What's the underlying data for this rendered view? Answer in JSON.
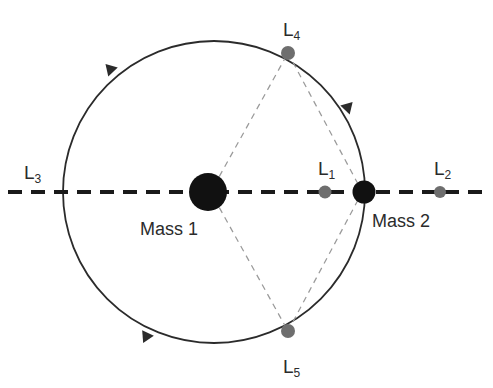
{
  "figure": {
    "background_color": "#ffffff"
  },
  "colors": {
    "body_fill": "#111111",
    "lagrange_fill": "#6e6e6e",
    "orbit_stroke": "#2b2b2b",
    "axis_stroke": "#1a1a1a",
    "connector_stroke": "#9a9a9a",
    "label_color": "#2b2b2b"
  },
  "bodies": [
    {
      "id": "mass-1",
      "label": "Mass 1",
      "label_base": "Mass",
      "label_index": "1",
      "cx": 208,
      "cy": 192,
      "r": 19,
      "fill": "#111111"
    },
    {
      "id": "mass-2",
      "label": "Mass 2",
      "label_base": "Mass",
      "label_index": "2",
      "cx": 364,
      "cy": 192,
      "r": 11.5,
      "fill": "#111111"
    }
  ],
  "lagrange_points": [
    {
      "id": "L1",
      "base": "L",
      "sub": "1",
      "cx": 325,
      "cy": 192,
      "r": 6.5,
      "has_marker": true,
      "label_x": 318,
      "label_y": 175,
      "fill": "#6e6e6e"
    },
    {
      "id": "L2",
      "base": "L",
      "sub": "2",
      "cx": 440,
      "cy": 192,
      "r": 6.0,
      "has_marker": true,
      "label_x": 434,
      "label_y": 175,
      "fill": "#6e6e6e"
    },
    {
      "id": "L3",
      "base": "L",
      "sub": "3",
      "cx": 33,
      "cy": 192,
      "r": 0,
      "has_marker": false,
      "label_x": 24,
      "label_y": 179,
      "fill": "#6e6e6e"
    },
    {
      "id": "L4",
      "base": "L",
      "sub": "4",
      "cx": 288,
      "cy": 53,
      "r": 7.0,
      "has_marker": true,
      "label_x": 283,
      "label_y": 36,
      "fill": "#6e6e6e"
    },
    {
      "id": "L5",
      "base": "L",
      "sub": "5",
      "cx": 288,
      "cy": 331,
      "r": 7.0,
      "has_marker": true,
      "label_x": 283,
      "label_y": 373,
      "fill": "#6e6e6e"
    }
  ],
  "orbit": {
    "cx": 214,
    "cy": 192,
    "r": 151,
    "stroke": "#2b2b2b",
    "stroke_width": 1.8,
    "direction": "counter-clockwise"
  },
  "axis_line": {
    "y": 192,
    "x_start": 8,
    "x_end": 486,
    "stroke": "#1a1a1a",
    "stroke_width": 4.2,
    "dash": "14 9"
  },
  "connectors": [
    {
      "id": "mass1-to-L4",
      "x1": 214,
      "y1": 186,
      "x2": 288,
      "y2": 53
    },
    {
      "id": "mass1-to-L5",
      "x1": 214,
      "y1": 198,
      "x2": 288,
      "y2": 331
    },
    {
      "id": "mass2-to-L4",
      "x1": 358,
      "y1": 184,
      "x2": 288,
      "y2": 53
    },
    {
      "id": "mass2-to-L5",
      "x1": 358,
      "y1": 200,
      "x2": 288,
      "y2": 331
    }
  ],
  "orbit_arrows": [
    {
      "id": "arrow-upper-left",
      "cx": 113,
      "cy": 72,
      "rotation": 227
    },
    {
      "id": "arrow-upper-right",
      "cx": 345,
      "cy": 110,
      "rotation": 314
    },
    {
      "id": "arrow-lower-left",
      "cx": 148,
      "cy": 333,
      "rotation": 116
    }
  ]
}
